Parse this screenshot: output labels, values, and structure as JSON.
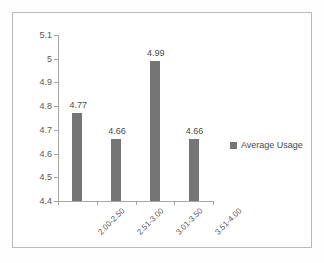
{
  "chart_data": {
    "type": "bar",
    "title": "",
    "subtitle": "",
    "xlabel": "",
    "ylabel": "",
    "categories": [
      "2.00-2.50",
      "2.51-3.00",
      "3.01-3.50",
      "3.51-4.00"
    ],
    "values": [
      4.77,
      4.66,
      4.99,
      4.66
    ],
    "data_labels": [
      "4.77",
      "4.66",
      "4.99",
      "4.66"
    ],
    "series": [
      {
        "name": "Average Usage",
        "values": [
          4.77,
          4.66,
          4.99,
          4.66
        ],
        "color": "#757575"
      }
    ],
    "ylim": [
      4.4,
      5.1
    ],
    "ytick_labels": [
      "5.1",
      "5",
      "4.9",
      "4.8",
      "4.7",
      "4.6",
      "4.5",
      "4.4"
    ],
    "ytick_values": [
      5.1,
      5.0,
      4.9,
      4.8,
      4.7,
      4.6,
      4.5,
      4.4
    ],
    "grid": false,
    "legend": {
      "position": "right",
      "entries": [
        {
          "label": "Average Usage",
          "marker": "square",
          "color": "#757575"
        }
      ]
    },
    "xtick_rotation": -45,
    "axis_color": "#a6a6a6",
    "text_color": "#595959",
    "frame_color": "#b9b9b9",
    "background": "#ffffff"
  }
}
